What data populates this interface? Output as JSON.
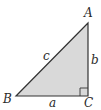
{
  "diagram": {
    "type": "right-triangle",
    "fill_color": "#d9d9d9",
    "stroke_color": "#333333",
    "vertices": [
      {
        "label": "A",
        "x": 88,
        "y": 23
      },
      {
        "label": "B",
        "x": 16,
        "y": 96
      },
      {
        "label": "C",
        "x": 88,
        "y": 96
      }
    ],
    "sides": [
      {
        "label": "c",
        "between": "A-B"
      },
      {
        "label": "b",
        "between": "A-C"
      },
      {
        "label": "a",
        "between": "B-C"
      }
    ],
    "right_angle_at": "C"
  }
}
